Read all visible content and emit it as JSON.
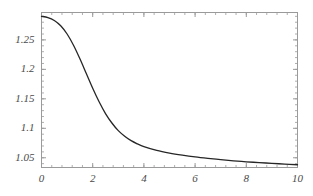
{
  "chart_data": {
    "type": "line",
    "title": "",
    "subtitle": "",
    "xlabel": "",
    "ylabel": "",
    "xlim": [
      0,
      10
    ],
    "ylim": [
      1.0335,
      1.2965
    ],
    "grid": false,
    "legend": null,
    "legend_position": "none",
    "frame": true,
    "tick_direction": "in",
    "line_color": "#262626",
    "frame_color": "#9a9a9a",
    "background_color": "#ffffff",
    "label_color": "#4a4a4a",
    "xticks": [
      {
        "value": 0,
        "label": "0"
      },
      {
        "value": 2,
        "label": "2"
      },
      {
        "value": 4,
        "label": "4"
      },
      {
        "value": 6,
        "label": "6"
      },
      {
        "value": 8,
        "label": "8"
      },
      {
        "value": 10,
        "label": "10"
      }
    ],
    "yticks": [
      {
        "value": 1.25,
        "label": "1.25"
      },
      {
        "value": 1.2,
        "label": "1.2"
      },
      {
        "value": 1.15,
        "label": "1.15"
      },
      {
        "value": 1.1,
        "label": "1.1"
      },
      {
        "value": 1.05,
        "label": "1.05"
      }
    ],
    "xminor_step": 0.4,
    "yminor_step": 0.01,
    "series": [
      {
        "name": "curve",
        "x": [
          0.0,
          0.25,
          0.5,
          0.75,
          1.0,
          1.25,
          1.5,
          1.75,
          2.0,
          2.25,
          2.5,
          2.75,
          3.0,
          3.25,
          3.5,
          3.75,
          4.0,
          4.5,
          5.0,
          5.5,
          6.0,
          6.5,
          7.0,
          7.5,
          8.0,
          8.5,
          9.0,
          9.5,
          10.0
        ],
        "y": [
          1.29,
          1.288,
          1.283,
          1.274,
          1.26,
          1.241,
          1.218,
          1.193,
          1.168,
          1.145,
          1.125,
          1.109,
          1.096,
          1.0865,
          1.079,
          1.0735,
          1.069,
          1.0625,
          1.058,
          1.0545,
          1.0515,
          1.049,
          1.0468,
          1.0449,
          1.0432,
          1.0418,
          1.0405,
          1.0393,
          1.0382
        ]
      }
    ]
  }
}
